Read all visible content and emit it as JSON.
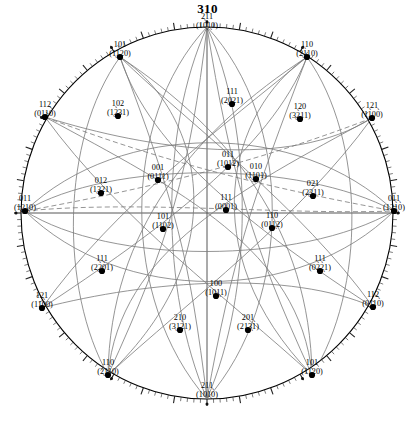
{
  "title": "310",
  "figure": {
    "type": "stereographic-projection",
    "center": [
      207,
      213
    ],
    "radius": 186,
    "tick_count": 180
  },
  "poles": [
    {
      "id": "p-2bar11",
      "miller": "2̖11",
      "bravais": "(10̖1̖0)",
      "x": 207,
      "y": 29,
      "align": "ctr",
      "dot": false
    },
    {
      "id": "p-101-tl",
      "miller": "101",
      "bravais": "(1̖1̖20)",
      "x": 120,
      "y": 57,
      "align": "ctr",
      "dot": true
    },
    {
      "id": "p-1bar10",
      "miller": "1̖10",
      "bravais": "(2̖110)",
      "x": 307,
      "y": 57,
      "align": "ctr",
      "dot": true
    },
    {
      "id": "p-112",
      "miller": "112",
      "bravais": "(01̖̖10)",
      "x": 45,
      "y": 117,
      "align": "ctr",
      "dot": true
    },
    {
      "id": "p-1bar21bar",
      "miller": "1̖21̖",
      "bravais": "(1̖100)",
      "x": 372,
      "y": 118,
      "align": "ctr",
      "dot": true
    },
    {
      "id": "p-1bar02",
      "miller": "1̖02",
      "bravais": "(1̖231)",
      "x": 118,
      "y": 116,
      "align": "ctr",
      "dot": true
    },
    {
      "id": "p-1bar20",
      "miller": "1̖20",
      "bravais": "(3̖211)",
      "x": 300,
      "y": 119,
      "align": "ctr",
      "dot": true
    },
    {
      "id": "p-111-up",
      "miller": "111",
      "bravais": "(2̖021)",
      "x": 232,
      "y": 104,
      "align": "ctr",
      "dot": true
    },
    {
      "id": "p-011",
      "miller": "011",
      "bravais": "(1̖012)",
      "x": 228,
      "y": 167,
      "align": "ctr",
      "dot": true
    },
    {
      "id": "p-010",
      "miller": "010",
      "bravais": "(1̖1̖01)",
      "x": 256,
      "y": 179,
      "align": "ctr",
      "dot": true
    },
    {
      "id": "p-001",
      "miller": "001",
      "bravais": "(01̖11)",
      "x": 158,
      "y": 180,
      "align": "ctr",
      "dot": true
    },
    {
      "id": "p-012",
      "miller": "012",
      "bravais": "(1̖321)",
      "x": 101,
      "y": 193,
      "align": "ctr",
      "dot": true
    },
    {
      "id": "p-021",
      "miller": "021",
      "bravais": "(2̖3̖11)",
      "x": 313,
      "y": 196,
      "align": "ctr",
      "dot": true
    },
    {
      "id": "p-011-left",
      "miller": "011",
      "bravais": "(1̖̖21̖0)",
      "x": 25,
      "y": 211,
      "align": "ctr",
      "dot": true
    },
    {
      "id": "p-01b1b",
      "miller": "01̖1̖",
      "bravais": "(121̖0)",
      "x": 394,
      "y": 211,
      "align": "ctr",
      "dot": true
    },
    {
      "id": "p-111-ctr",
      "miller": "111",
      "bravais": "(0001)",
      "x": 226,
      "y": 210,
      "align": "ctr",
      "dot": true
    },
    {
      "id": "p-101-mid",
      "miller": "101",
      "bravais": "(11̖02)",
      "x": 163,
      "y": 229,
      "align": "ctr",
      "dot": true
    },
    {
      "id": "p-110",
      "miller": "110",
      "bravais": "(011̖2)",
      "x": 272,
      "y": 228,
      "align": "ctr",
      "dot": true
    },
    {
      "id": "p-1b1b1",
      "miller": "1̖1̖1",
      "bravais": "(2̖2̖01)",
      "x": 102,
      "y": 271,
      "align": "ctr",
      "dot": true
    },
    {
      "id": "p-1b1b1-r",
      "miller": "1̖1̖1",
      "bravais": "(02̖2̖1)",
      "x": 320,
      "y": 271,
      "align": "ctr",
      "dot": true
    },
    {
      "id": "p-12b1",
      "miller": "12̖1",
      "bravais": "(11̖00)",
      "x": 42,
      "y": 308,
      "align": "ctr",
      "dot": true
    },
    {
      "id": "p-112-r",
      "miller": "112̖",
      "bravais": "(01̖10)",
      "x": 373,
      "y": 307,
      "align": "ctr",
      "dot": true
    },
    {
      "id": "p-100",
      "miller": "100",
      "bravais": "(101̖1)",
      "x": 216,
      "y": 296,
      "align": "ctr",
      "dot": true
    },
    {
      "id": "p-21b0",
      "miller": "21̖0",
      "bravais": "(3̖121)",
      "x": 180,
      "y": 330,
      "align": "ctr",
      "dot": true
    },
    {
      "id": "p-201b",
      "miller": "201̖",
      "bravais": "(213̖1)",
      "x": 248,
      "y": 330,
      "align": "ctr",
      "dot": true
    },
    {
      "id": "p-11b0",
      "miller": "11̖0",
      "bravais": "(2̖110)",
      "x": 108,
      "y": 375,
      "align": "ctr",
      "dot": true
    },
    {
      "id": "p-101-br",
      "miller": "101",
      "bravais": "(11̖20)",
      "x": 312,
      "y": 375,
      "align": "ctr",
      "dot": true
    },
    {
      "id": "p-211",
      "miller": "211̖",
      "bravais": "(101̖0)",
      "x": 207,
      "y": 398,
      "align": "ctr",
      "dot": false
    }
  ],
  "colors": {
    "ink": "#000000",
    "curve": "#6b6b6b",
    "background": "#ffffff"
  }
}
